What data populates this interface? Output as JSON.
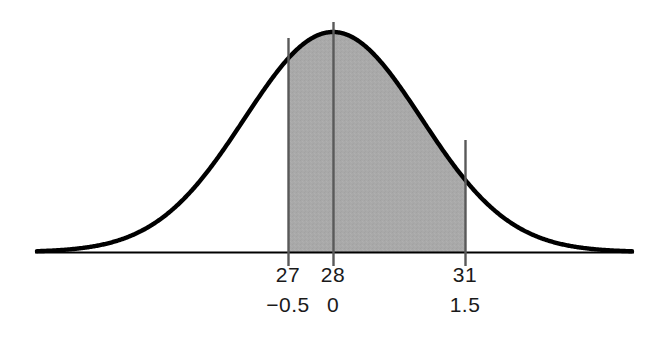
{
  "figure": {
    "name": "normal-distribution-shaded-area",
    "background_color": "#ffffff",
    "curve_color": "#000000",
    "axis_color": "#000000",
    "shade_color": "#a8a8a8",
    "gridline_color": "#595959",
    "label_color": "#1a1a1a"
  },
  "axis": {
    "raw_labels": [
      "27",
      "28",
      "31"
    ],
    "z_labels": [
      "−0.5",
      "0",
      "1.5"
    ]
  },
  "chart_data": {
    "type": "area",
    "title": "",
    "xlabel": "",
    "ylabel": "",
    "distribution": "normal",
    "mean": 28,
    "sd": 2,
    "shaded_interval_raw": [
      27,
      31
    ],
    "shaded_interval_z": [
      -0.5,
      1.5
    ],
    "ticks": [
      {
        "raw": 27,
        "z": -0.5,
        "raw_label": "27",
        "z_label": "−0.5",
        "x_px": 288,
        "is_boundary": true
      },
      {
        "raw": 28,
        "z": 0,
        "raw_label": "28",
        "z_label": "0",
        "x_px": 333,
        "is_boundary": false
      },
      {
        "raw": 31,
        "z": 1.5,
        "raw_label": "31",
        "z_label": "1.5",
        "x_px": 465,
        "is_boundary": true
      }
    ],
    "grid": false,
    "legend": "none",
    "xlim_z": [
      -3.3,
      3.3
    ],
    "curve_peak_px": {
      "x": 333,
      "y": 32
    },
    "baseline_y_px": 252
  }
}
